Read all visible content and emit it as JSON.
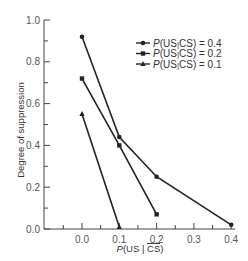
{
  "chart_data": {
    "type": "line",
    "title": "",
    "xlabel": "P(US | CS̄)",
    "xlabel_parts": {
      "italic": "P",
      "text": "(US | ",
      "overline": "CS",
      "close": ")"
    },
    "ylabel": "Degree of suppression",
    "xlim": [
      -0.1,
      0.4
    ],
    "ylim": [
      0.0,
      1.0
    ],
    "x_ticks": [
      0.0,
      0.1,
      0.2,
      0.3,
      0.4
    ],
    "x_tick_labels": [
      "0.0",
      "0.1",
      "0.2",
      "0.3",
      "0.4"
    ],
    "y_ticks": [
      0.0,
      0.2,
      0.4,
      0.6,
      0.8,
      1.0
    ],
    "y_tick_labels": [
      "0.0",
      "0.2",
      "0.4",
      "0.6",
      "0.8",
      "1.0"
    ],
    "grid": false,
    "legend_position": "upper right",
    "series": [
      {
        "name": "P(US|CS) = 0.4",
        "label_value": "0.4",
        "marker": "circle",
        "x": [
          0.0,
          0.1,
          0.2,
          0.4
        ],
        "values": [
          0.92,
          0.44,
          0.25,
          0.02
        ]
      },
      {
        "name": "P(US|CS) = 0.2",
        "label_value": "0.2",
        "marker": "square",
        "x": [
          0.0,
          0.1,
          0.2
        ],
        "values": [
          0.72,
          0.4,
          0.07
        ]
      },
      {
        "name": "P(US|CS) = 0.1",
        "label_value": "0.1",
        "marker": "triangle",
        "x": [
          0.0,
          0.1
        ],
        "values": [
          0.55,
          0.01
        ]
      }
    ],
    "colors": {
      "line": "#222222",
      "axis": "#444444",
      "text": "#555555"
    }
  },
  "legend": {
    "items": [
      {
        "prefix": "P",
        "middle": "(US",
        "cs": "CS) = 0.4"
      },
      {
        "prefix": "P",
        "middle": "(US",
        "cs": "CS) = 0.2"
      },
      {
        "prefix": "P",
        "middle": "(US",
        "cs": "CS) = 0.1"
      }
    ]
  },
  "axis": {
    "ylabel": "Degree of suppression",
    "xlabel_italic": "P",
    "xlabel_open": "(US | ",
    "xlabel_overline": "CS",
    "xlabel_close": ")"
  }
}
